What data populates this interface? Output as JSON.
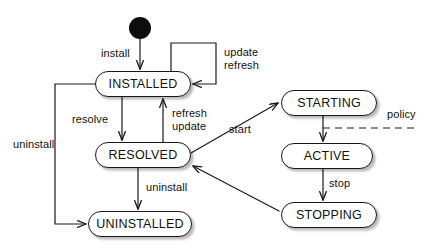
{
  "diagram": {
    "type": "uml-state-machine",
    "background_color": "#ffffff",
    "stroke_color": "#1a1a1a",
    "text_color": "#111111",
    "initial_state": {
      "name": "initial-node",
      "shape": "filled-circle",
      "color": "#0d0d0d",
      "cx": 140,
      "cy": 28,
      "r": 11
    },
    "states": [
      {
        "id": "installed",
        "label": "INSTALLED",
        "x": 95,
        "y": 71,
        "w": 96,
        "h": 26
      },
      {
        "id": "resolved",
        "label": "RESOLVED",
        "x": 95,
        "y": 142,
        "w": 96,
        "h": 26
      },
      {
        "id": "uninstalled",
        "label": "UNINSTALLED",
        "x": 88,
        "y": 211,
        "w": 104,
        "h": 26
      },
      {
        "id": "starting",
        "label": "STARTING",
        "x": 281,
        "y": 90,
        "w": 96,
        "h": 26
      },
      {
        "id": "active",
        "label": "ACTIVE",
        "x": 281,
        "y": 143,
        "w": 92,
        "h": 26
      },
      {
        "id": "stopping",
        "label": "STOPPING",
        "x": 281,
        "y": 202,
        "w": 96,
        "h": 26
      }
    ],
    "transitions": [
      {
        "id": "t-install",
        "from": "initial",
        "to": "installed",
        "label": "install",
        "style": "solid"
      },
      {
        "id": "t-update-refresh",
        "from": "installed",
        "to": "installed",
        "label": "update\nrefresh",
        "style": "solid",
        "self_loop": true
      },
      {
        "id": "t-resolve",
        "from": "installed",
        "to": "resolved",
        "label": "resolve",
        "style": "solid"
      },
      {
        "id": "t-refresh-update",
        "from": "resolved",
        "to": "installed",
        "label": "refresh\nupdate",
        "style": "solid"
      },
      {
        "id": "t-uninstall-left",
        "from": "installed",
        "to": "uninstalled",
        "label": "uninstall",
        "style": "solid"
      },
      {
        "id": "t-uninstall-mid",
        "from": "resolved",
        "to": "uninstalled",
        "label": "uninstall",
        "style": "solid"
      },
      {
        "id": "t-start",
        "from": "resolved",
        "to": "starting",
        "label": "start",
        "style": "solid"
      },
      {
        "id": "t-policy",
        "from": "starting",
        "to": "active",
        "label": "policy",
        "style": "dashed"
      },
      {
        "id": "t-stop",
        "from": "active",
        "to": "stopping",
        "label": "stop",
        "style": "solid"
      },
      {
        "id": "t-stopping-resolved",
        "from": "stopping",
        "to": "resolved",
        "label": "",
        "style": "solid"
      }
    ],
    "labels": {
      "install": {
        "text": "install",
        "x": 101,
        "y": 47
      },
      "update": {
        "text": "update",
        "x": 224,
        "y": 52
      },
      "refresh_loop": {
        "text": "refresh",
        "x": 224,
        "y": 64
      },
      "resolve": {
        "text": "resolve",
        "x": 72,
        "y": 114
      },
      "refresh": {
        "text": "refresh",
        "x": 172,
        "y": 110
      },
      "update2": {
        "text": "update",
        "x": 172,
        "y": 122
      },
      "uninstall_left": {
        "text": "uninstall",
        "x": 13,
        "y": 139
      },
      "uninstall_mid": {
        "text": "uninstall",
        "x": 146,
        "y": 182
      },
      "start": {
        "text": "start",
        "x": 229,
        "y": 124
      },
      "policy": {
        "text": "policy",
        "x": 387,
        "y": 113
      },
      "stop": {
        "text": "stop",
        "x": 329,
        "y": 180
      }
    }
  }
}
